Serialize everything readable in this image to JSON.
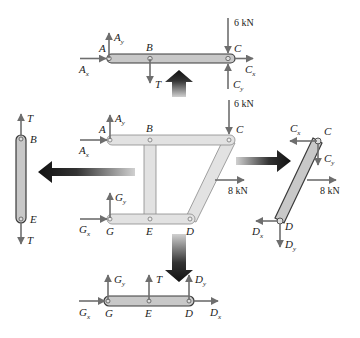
{
  "diagram": {
    "colors": {
      "member_fill": "#d4d4d4",
      "member_fill_light": "#e2e2e2",
      "member_stroke": "#6d6d6d",
      "member_dark_stroke": "#3a3a3a",
      "force_arrow": "#6e6e6e",
      "big_arrow_dark": "#111111",
      "big_arrow_light": "#bdbdbd"
    },
    "top_member": {
      "labels": {
        "A": "A",
        "B": "B",
        "C": "C"
      },
      "forces": {
        "Ay": {
          "main": "A",
          "sub": "y"
        },
        "Ax": {
          "main": "A",
          "sub": "x"
        },
        "T": {
          "main": "T"
        },
        "load": "6 kN",
        "Cx": {
          "main": "C",
          "sub": "x"
        },
        "Cy": {
          "main": "C",
          "sub": "y"
        }
      }
    },
    "main_frame": {
      "labels": {
        "A": "A",
        "B": "B",
        "C": "C",
        "G": "G",
        "E": "E",
        "D": "D"
      },
      "forces": {
        "Ay": {
          "main": "A",
          "sub": "y"
        },
        "Ax": {
          "main": "A",
          "sub": "x"
        },
        "Gy": {
          "main": "G",
          "sub": "y"
        },
        "Gx": {
          "main": "G",
          "sub": "x"
        },
        "load_top": "6 kN",
        "load_side": "8 kN"
      }
    },
    "left_member": {
      "labels": {
        "B": "B",
        "E": "E"
      },
      "forces": {
        "T_top": {
          "main": "T"
        },
        "T_bottom": {
          "main": "T"
        }
      }
    },
    "right_member": {
      "labels": {
        "C": "C",
        "D": "D"
      },
      "forces": {
        "Cx": {
          "main": "C",
          "sub": "x"
        },
        "Cy": {
          "main": "C",
          "sub": "y"
        },
        "load": "8 kN",
        "Dx": {
          "main": "D",
          "sub": "x"
        },
        "Dy": {
          "main": "D",
          "sub": "y"
        }
      }
    },
    "bottom_member": {
      "labels": {
        "G": "G",
        "E": "E",
        "D": "D"
      },
      "forces": {
        "Gy": {
          "main": "G",
          "sub": "y"
        },
        "Gx": {
          "main": "G",
          "sub": "x"
        },
        "T": {
          "main": "T"
        },
        "Dy": {
          "main": "D",
          "sub": "y"
        },
        "Dx": {
          "main": "D",
          "sub": "x"
        }
      }
    }
  }
}
